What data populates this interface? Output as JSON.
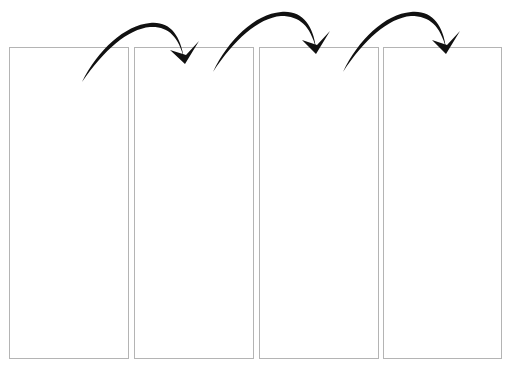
{
  "diagram": {
    "type": "sequence-of-panels",
    "panels": [
      {
        "id": "panel-1",
        "x": 9,
        "width": 120
      },
      {
        "id": "panel-2",
        "x": 134,
        "width": 120
      },
      {
        "id": "panel-3",
        "x": 259,
        "width": 120
      },
      {
        "id": "panel-4",
        "x": 383,
        "width": 119
      }
    ],
    "arrows": [
      {
        "from": "panel-1",
        "to": "panel-2"
      },
      {
        "from": "panel-2",
        "to": "panel-3"
      },
      {
        "from": "panel-3",
        "to": "panel-4"
      }
    ],
    "colors": {
      "border": "#b4b4b4",
      "arrow": "#111111",
      "background": "#ffffff"
    }
  }
}
